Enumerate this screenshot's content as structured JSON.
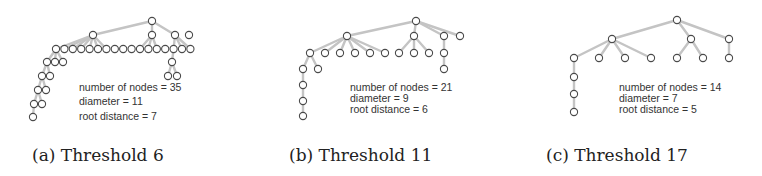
{
  "figures": [
    {
      "id": "a",
      "caption": "(a) Threshold 6",
      "stats": {
        "nodes": "number of nodes = 35",
        "diameter": "diameter = 11",
        "root_distance": "root distance = 7"
      },
      "tree": {
        "node_count": 35,
        "diameter": 11,
        "root_distance": 7
      }
    },
    {
      "id": "b",
      "caption": "(b) Threshold 11",
      "stats": {
        "nodes": "number of nodes = 21",
        "diameter": "diameter = 9",
        "root_distance": "root distance = 6"
      },
      "tree": {
        "node_count": 21,
        "diameter": 9,
        "root_distance": 6
      }
    },
    {
      "id": "c",
      "caption": "(c) Threshold 17",
      "stats": {
        "nodes": "number of nodes = 14",
        "diameter": "diameter = 7",
        "root_distance": "root distance = 5"
      },
      "tree": {
        "node_count": 14,
        "diameter": 7,
        "root_distance": 5
      }
    }
  ],
  "colors": {
    "edge": "#c4c4c4",
    "node_stroke": "#4a4a4a",
    "node_fill": "#ffffff"
  }
}
